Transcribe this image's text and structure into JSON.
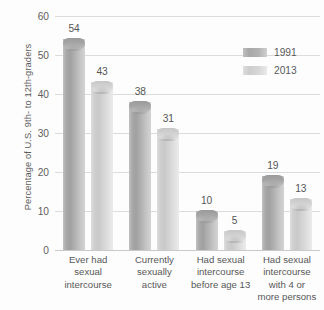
{
  "chart_data": {
    "type": "bar",
    "title": "",
    "subtitle": "",
    "xlabel": "",
    "ylabel": "Percentage of U.S. 9th- to 12th-graders",
    "ylim": [
      0,
      60
    ],
    "ytick_labels": [
      "60",
      "50",
      "40",
      "30",
      "20",
      "10",
      "0"
    ],
    "ytick_values": [
      60,
      50,
      40,
      30,
      20,
      10,
      0
    ],
    "grid": true,
    "legend_position": "top-right",
    "categories": [
      "Ever had\nsexual\nintercourse",
      "Currently\nsexually\nactive",
      "Had sexual\nintercourse\nbefore age 13",
      "Had sexual\nintercourse\nwith 4 or\nmore persons"
    ],
    "series": [
      {
        "name": "1991",
        "color": "#aaaaaa",
        "values": [
          54,
          38,
          10,
          19
        ]
      },
      {
        "name": "2013",
        "color": "#d4d4d4",
        "values": [
          43,
          31,
          5,
          13
        ]
      }
    ]
  },
  "legend": {
    "entries": [
      {
        "label": "1991"
      },
      {
        "label": "2013"
      }
    ]
  }
}
